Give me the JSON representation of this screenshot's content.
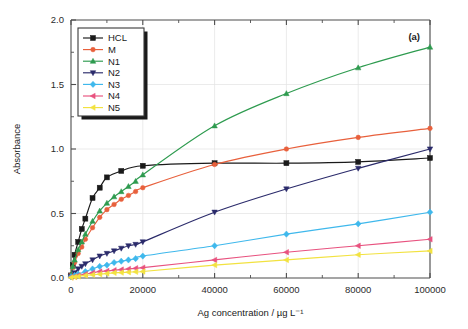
{
  "figure": {
    "panel_label": "(a)",
    "background": "#ffffff"
  },
  "chart_data": {
    "type": "line",
    "title": "",
    "xlabel": "Ag concentration / µg L⁻¹",
    "ylabel": "Absorbance",
    "xlim": [
      0,
      100000
    ],
    "ylim": [
      0.0,
      2.0
    ],
    "xticks": [
      0,
      20000,
      40000,
      60000,
      80000,
      100000
    ],
    "xticklabels": [
      "0",
      "20000",
      "40000",
      "60000",
      "80000",
      "100000"
    ],
    "yticks": [
      0.0,
      0.5,
      1.0,
      1.5,
      2.0
    ],
    "yticklabels": [
      "0.0",
      "0.5",
      "1.0",
      "1.5",
      "2.0"
    ],
    "yminor": [
      0.25,
      0.75,
      1.25,
      1.75
    ],
    "xminor": [
      10000,
      30000,
      50000,
      70000,
      90000
    ],
    "grid": true,
    "grid_color": "#e2e2e2",
    "legend_position": "top-left",
    "series": [
      {
        "name": "HCL",
        "color": "#1a1a1a",
        "marker": "square",
        "x": [
          0,
          500,
          1000,
          2000,
          3000,
          4000,
          6000,
          8000,
          10000,
          14000,
          20000,
          40000,
          60000,
          80000,
          100000
        ],
        "values": [
          0.02,
          0.1,
          0.18,
          0.28,
          0.38,
          0.46,
          0.62,
          0.7,
          0.78,
          0.83,
          0.87,
          0.89,
          0.89,
          0.9,
          0.93
        ]
      },
      {
        "name": "M",
        "color": "#e8603c",
        "marker": "circle",
        "x": [
          0,
          500,
          1000,
          2000,
          3000,
          4000,
          6000,
          8000,
          10000,
          12000,
          14000,
          16000,
          18000,
          20000,
          40000,
          60000,
          80000,
          100000
        ],
        "values": [
          0.02,
          0.08,
          0.12,
          0.19,
          0.24,
          0.3,
          0.39,
          0.47,
          0.53,
          0.57,
          0.61,
          0.64,
          0.67,
          0.7,
          0.88,
          1.0,
          1.09,
          1.16
        ]
      },
      {
        "name": "N1",
        "color": "#2e9b4f",
        "marker": "triangle-up",
        "x": [
          0,
          500,
          1000,
          2000,
          3000,
          4000,
          6000,
          8000,
          10000,
          12000,
          14000,
          16000,
          18000,
          20000,
          40000,
          60000,
          80000,
          100000
        ],
        "values": [
          0.02,
          0.09,
          0.14,
          0.22,
          0.28,
          0.34,
          0.44,
          0.52,
          0.58,
          0.63,
          0.67,
          0.71,
          0.75,
          0.8,
          1.18,
          1.43,
          1.63,
          1.79
        ]
      },
      {
        "name": "N2",
        "color": "#2b2b6b",
        "marker": "triangle-down",
        "x": [
          0,
          1000,
          2000,
          3000,
          4000,
          6000,
          8000,
          10000,
          12000,
          14000,
          16000,
          18000,
          20000,
          40000,
          60000,
          80000,
          100000
        ],
        "values": [
          0.01,
          0.04,
          0.07,
          0.09,
          0.11,
          0.14,
          0.17,
          0.19,
          0.21,
          0.23,
          0.25,
          0.26,
          0.28,
          0.51,
          0.69,
          0.85,
          1.0
        ]
      },
      {
        "name": "N3",
        "color": "#3fb8ec",
        "marker": "diamond",
        "x": [
          0,
          1000,
          2000,
          4000,
          6000,
          8000,
          10000,
          12000,
          14000,
          16000,
          18000,
          20000,
          40000,
          60000,
          80000,
          100000
        ],
        "values": [
          0.01,
          0.02,
          0.03,
          0.05,
          0.07,
          0.09,
          0.1,
          0.12,
          0.13,
          0.14,
          0.15,
          0.17,
          0.25,
          0.34,
          0.42,
          0.51
        ]
      },
      {
        "name": "N4",
        "color": "#e8527f",
        "marker": "triangle-left",
        "x": [
          0,
          1000,
          2000,
          4000,
          6000,
          8000,
          10000,
          12000,
          14000,
          16000,
          18000,
          20000,
          40000,
          60000,
          80000,
          100000
        ],
        "values": [
          0.005,
          0.01,
          0.02,
          0.03,
          0.04,
          0.05,
          0.055,
          0.06,
          0.065,
          0.07,
          0.075,
          0.08,
          0.14,
          0.2,
          0.25,
          0.3
        ]
      },
      {
        "name": "N5",
        "color": "#f2e240",
        "marker": "triangle-left",
        "x": [
          0,
          1000,
          2000,
          4000,
          6000,
          8000,
          10000,
          12000,
          14000,
          16000,
          18000,
          20000,
          40000,
          60000,
          80000,
          100000
        ],
        "values": [
          0.003,
          0.008,
          0.012,
          0.02,
          0.025,
          0.03,
          0.035,
          0.04,
          0.042,
          0.045,
          0.048,
          0.05,
          0.1,
          0.14,
          0.18,
          0.21
        ]
      }
    ]
  },
  "legend": {
    "entries": [
      "HCL",
      "M",
      "N1",
      "N2",
      "N3",
      "N4",
      "N5"
    ]
  }
}
